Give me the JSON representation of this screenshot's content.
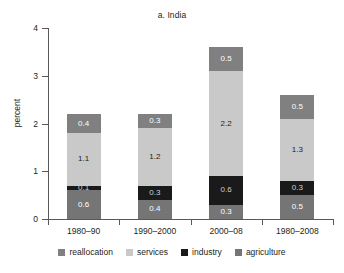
{
  "chart_data": {
    "type": "bar",
    "subtype": "stacked-bar",
    "title": "a. India",
    "xlabel": "",
    "ylabel": "percent",
    "ylim": [
      0,
      4
    ],
    "yticks": [
      "0",
      "1",
      "2",
      "3",
      "4"
    ],
    "grid": false,
    "legend_position": "bottom",
    "categories": [
      "1980–90",
      "1990–2000",
      "2000–08",
      "1980–2008"
    ],
    "series": [
      {
        "name": "agriculture",
        "color": "#757575",
        "text_on_fill": "light",
        "values": [
          0.6,
          0.4,
          0.3,
          0.5
        ],
        "labels": [
          "0.6",
          "0.4",
          "0.3",
          "0.5"
        ]
      },
      {
        "name": "industry",
        "color": "#1a1a1a",
        "text_on_fill": "black",
        "values": [
          0.1,
          0.3,
          0.6,
          0.3
        ],
        "labels": [
          "0.1",
          "0.3",
          "0.6",
          "0.3"
        ]
      },
      {
        "name": "services",
        "color": "#c9c9c9",
        "text_on_fill": "dark-text",
        "values": [
          1.1,
          1.2,
          2.2,
          1.3
        ],
        "labels": [
          "1.1",
          "1.2",
          "2.2",
          "1.3"
        ]
      },
      {
        "name": "reallocation",
        "color": "#808080",
        "text_on_fill": "light",
        "values": [
          0.4,
          0.3,
          0.5,
          0.5
        ],
        "labels": [
          "0.4",
          "0.3",
          "0.5",
          "0.5"
        ]
      }
    ],
    "totals": [
      2.2,
      2.2,
      3.6,
      2.6
    ],
    "legend_order": [
      "reallocation",
      "services",
      "industry",
      "agriculture"
    ]
  },
  "legend": {
    "items": [
      {
        "label": "reallocation",
        "color": "#808080"
      },
      {
        "label": "services",
        "color": "#c9c9c9"
      },
      {
        "label": "industry",
        "color": "#1a1a1a"
      },
      {
        "label": "agriculture",
        "color": "#757575"
      }
    ]
  },
  "axis": {
    "y_title": "percent",
    "y_ticks": [
      "4",
      "3",
      "2",
      "1",
      "0"
    ]
  }
}
